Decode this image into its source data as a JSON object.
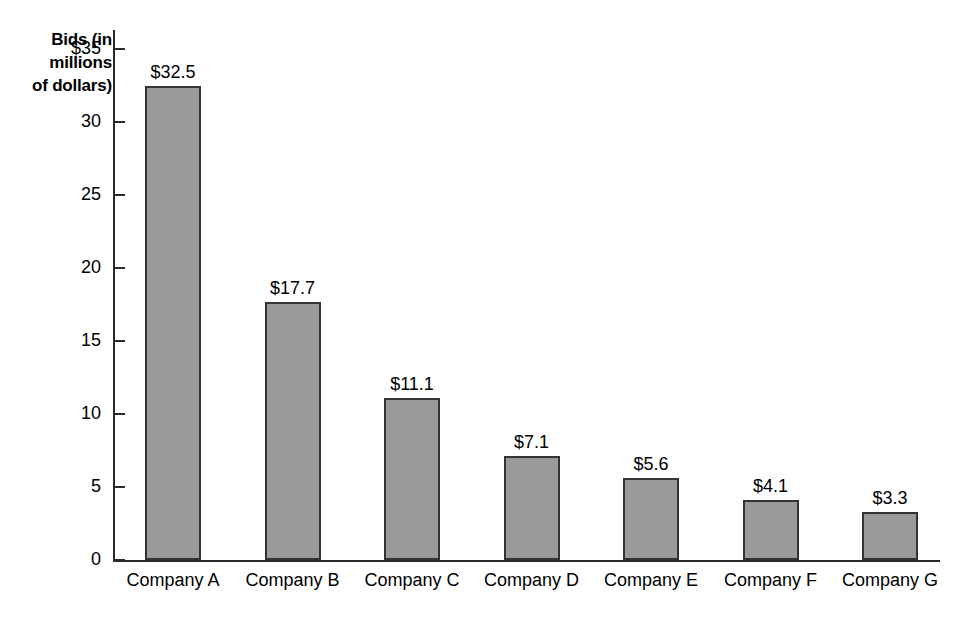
{
  "chart_data": {
    "type": "bar",
    "title": "",
    "ylabel": "Bids (in millions of dollars)",
    "ylabel_lines": [
      "Bids (in",
      "millions",
      "of dollars)"
    ],
    "xlabel": "",
    "categories": [
      "Company A",
      "Company B",
      "Company C",
      "Company D",
      "Company E",
      "Company F",
      "Company G"
    ],
    "values": [
      32.5,
      17.7,
      11.1,
      7.1,
      5.6,
      4.1,
      3.3
    ],
    "value_labels": [
      "$32.5",
      "$17.7",
      "$11.1",
      "$7.1",
      "$5.6",
      "$4.1",
      "$3.3"
    ],
    "ytick_values": [
      35,
      30,
      25,
      20,
      15,
      10,
      5,
      0
    ],
    "ytick_labels": [
      "$35",
      "30",
      "25",
      "20",
      "15",
      "10",
      "5",
      "0"
    ],
    "ylim": [
      0,
      35
    ],
    "grid": false,
    "legend": false,
    "bar_color": "#9a9a9a",
    "bar_edge_color": "#333333",
    "axis_color": "#2b2b2b",
    "background_color": "#ffffff",
    "text_color": "#000000"
  }
}
